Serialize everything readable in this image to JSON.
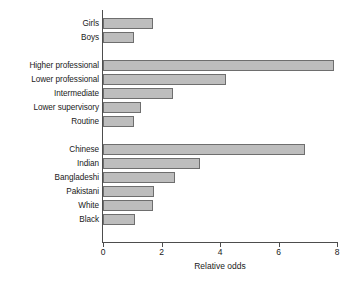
{
  "chart_data": {
    "type": "bar",
    "orientation": "horizontal",
    "title": "",
    "subtitle": "",
    "xlabel": "Relative odds",
    "ylabel": "",
    "xlim": [
      0,
      8
    ],
    "xticks": [
      0,
      2,
      4,
      6,
      8
    ],
    "xtick_labels": [
      "0",
      "2",
      "4",
      "6",
      "8"
    ],
    "grid": false,
    "legend": false,
    "legend_position": "none",
    "bar_fill_color": "#bdbdbd",
    "bar_edge_color": "#6e6e6e",
    "axis_color": "#4d4d4d",
    "groups": [
      {
        "name": "sex",
        "categories": [
          "Girls",
          "Boys"
        ],
        "values": [
          1.7,
          1.05
        ]
      },
      {
        "name": "social-class",
        "categories": [
          "Higher professional",
          "Lower professional",
          "Intermediate",
          "Lower supervisory",
          "Routine"
        ],
        "values": [
          7.9,
          4.2,
          2.4,
          1.3,
          1.05
        ]
      },
      {
        "name": "ethnicity",
        "categories": [
          "Chinese",
          "Indian",
          "Bangladeshi",
          "Pakistani",
          "White",
          "Black"
        ],
        "values": [
          6.9,
          3.3,
          2.45,
          1.75,
          1.7,
          1.1
        ]
      }
    ],
    "categories": [
      "Girls",
      "Boys",
      "Higher professional",
      "Lower professional",
      "Intermediate",
      "Lower supervisory",
      "Routine",
      "Chinese",
      "Indian",
      "Bangladeshi",
      "Pakistani",
      "White",
      "Black"
    ],
    "values": [
      1.7,
      1.05,
      7.9,
      4.2,
      2.4,
      1.3,
      1.05,
      6.9,
      3.3,
      2.45,
      1.75,
      1.7,
      1.1
    ]
  }
}
